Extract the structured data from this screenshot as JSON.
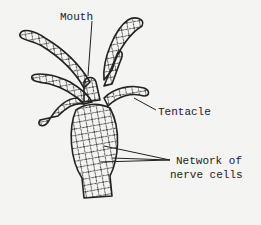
{
  "diagram": {
    "labels": {
      "mouth": "Mouth",
      "tentacle": "Tentacle",
      "network_line1": "Network of",
      "network_line2": "nerve cells"
    },
    "colors": {
      "background": "#f4f4f2",
      "ink": "#222222"
    }
  }
}
